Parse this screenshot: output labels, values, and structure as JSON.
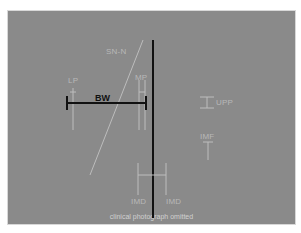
{
  "figure": {
    "placeholder_text": "clinical photograph omitted",
    "labels": {
      "sn_n": "SN-N",
      "lp": "LP",
      "mp": "MP",
      "bw": "BW",
      "upp": "UPP",
      "imf": "IMF",
      "imd_left": "IMD",
      "imd_right": "IMD"
    },
    "colors": {
      "midline": "#111111",
      "bw_line": "#111111",
      "annotation": "#b8b8b8"
    }
  }
}
